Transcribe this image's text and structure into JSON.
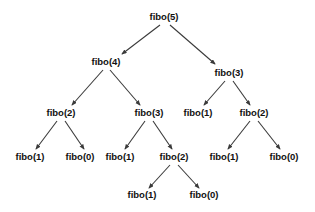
{
  "diagram": {
    "type": "recursion-tree",
    "title": "",
    "background_color": "#ffffff",
    "text_color": "#111111",
    "edge_color": "#3a3a3a",
    "nodes": [
      {
        "id": "n0",
        "label": "fibo(5)",
        "level": 0,
        "x": 164,
        "y": 17
      },
      {
        "id": "n1",
        "label": "fibo(4)",
        "level": 1,
        "x": 106,
        "y": 62
      },
      {
        "id": "n2",
        "label": "fibo(3)",
        "level": 1,
        "x": 229,
        "y": 73
      },
      {
        "id": "n3",
        "label": "fibo(2)",
        "level": 2,
        "x": 61,
        "y": 113
      },
      {
        "id": "n4",
        "label": "fibo(3)",
        "level": 2,
        "x": 149,
        "y": 113
      },
      {
        "id": "n5",
        "label": "fibo(1)",
        "level": 2,
        "x": 198,
        "y": 113
      },
      {
        "id": "n6",
        "label": "fibo(2)",
        "level": 2,
        "x": 254,
        "y": 113
      },
      {
        "id": "n7",
        "label": "fibo(1)",
        "level": 3,
        "x": 30,
        "y": 157
      },
      {
        "id": "n8",
        "label": "fibo(0)",
        "level": 3,
        "x": 80,
        "y": 157
      },
      {
        "id": "n9",
        "label": "fibo(1)",
        "level": 3,
        "x": 120,
        "y": 157
      },
      {
        "id": "n10",
        "label": "fibo(2)",
        "level": 3,
        "x": 174,
        "y": 157
      },
      {
        "id": "n11",
        "label": "fibo(1)",
        "level": 3,
        "x": 224,
        "y": 157
      },
      {
        "id": "n12",
        "label": "fibo(0)",
        "level": 3,
        "x": 284,
        "y": 157
      },
      {
        "id": "n13",
        "label": "fibo(1)",
        "level": 4,
        "x": 142,
        "y": 195
      },
      {
        "id": "n14",
        "label": "fibo(0)",
        "level": 4,
        "x": 204,
        "y": 195
      }
    ],
    "edges": [
      {
        "from": "n0",
        "to": "n1",
        "x1": 160,
        "y1": 25,
        "x2": 122,
        "y2": 54
      },
      {
        "from": "n0",
        "to": "n2",
        "x1": 170,
        "y1": 25,
        "x2": 215,
        "y2": 64
      },
      {
        "from": "n1",
        "to": "n3",
        "x1": 103,
        "y1": 70,
        "x2": 72,
        "y2": 105
      },
      {
        "from": "n1",
        "to": "n4",
        "x1": 110,
        "y1": 70,
        "x2": 140,
        "y2": 105
      },
      {
        "from": "n2",
        "to": "n5",
        "x1": 225,
        "y1": 81,
        "x2": 204,
        "y2": 105
      },
      {
        "from": "n2",
        "to": "n6",
        "x1": 233,
        "y1": 81,
        "x2": 250,
        "y2": 105
      },
      {
        "from": "n3",
        "to": "n7",
        "x1": 57,
        "y1": 121,
        "x2": 36,
        "y2": 149
      },
      {
        "from": "n3",
        "to": "n8",
        "x1": 65,
        "y1": 121,
        "x2": 84,
        "y2": 149
      },
      {
        "from": "n4",
        "to": "n9",
        "x1": 145,
        "y1": 121,
        "x2": 125,
        "y2": 149
      },
      {
        "from": "n4",
        "to": "n10",
        "x1": 153,
        "y1": 121,
        "x2": 172,
        "y2": 149
      },
      {
        "from": "n6",
        "to": "n11",
        "x1": 250,
        "y1": 121,
        "x2": 228,
        "y2": 149
      },
      {
        "from": "n6",
        "to": "n12",
        "x1": 258,
        "y1": 121,
        "x2": 280,
        "y2": 149
      },
      {
        "from": "n10",
        "to": "n13",
        "x1": 170,
        "y1": 165,
        "x2": 149,
        "y2": 188
      },
      {
        "from": "n10",
        "to": "n14",
        "x1": 178,
        "y1": 165,
        "x2": 199,
        "y2": 188
      }
    ]
  }
}
